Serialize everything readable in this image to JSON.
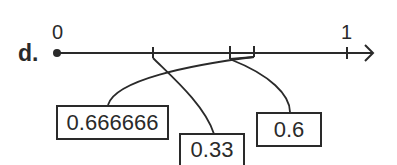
{
  "part_label": "d.",
  "number_line": {
    "start_label": "0",
    "end_label": "1",
    "line_color": "#2a2a2a"
  },
  "boxes": [
    {
      "id": "box-a",
      "text": "0.666666",
      "points_to": "tick near 0.6 (right bracket)"
    },
    {
      "id": "box-b",
      "text": "0.33",
      "points_to": "tick near 0.33"
    },
    {
      "id": "box-c",
      "text": "0.6",
      "points_to": "tick near 0.6 (left bracket)"
    }
  ]
}
